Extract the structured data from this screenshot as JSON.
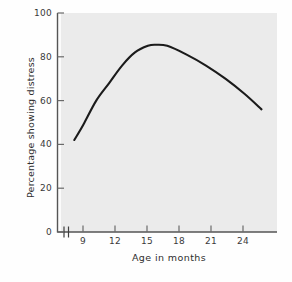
{
  "chart_data": {
    "type": "line",
    "title": "",
    "xlabel": "Age in months",
    "ylabel": "Percentage showing distress",
    "xlim": [
      8,
      25
    ],
    "ylim": [
      0,
      100
    ],
    "xticks": [
      9,
      12,
      15,
      18,
      21,
      24
    ],
    "xtick_labels": [
      "9",
      "12",
      "15",
      "18",
      "21",
      "24"
    ],
    "yticks": [
      0,
      20,
      40,
      60,
      80,
      100
    ],
    "ytick_labels": [
      "0",
      "20",
      "40",
      "60",
      "80",
      "100"
    ],
    "grid": false,
    "legend": null,
    "axis_break_x": true,
    "series": [
      {
        "name": "Percentage showing distress",
        "color": "#1b1b1b",
        "x": [
          9.3,
          10.0,
          11.0,
          12.0,
          13.0,
          14.0,
          15.0,
          15.6,
          16.5,
          18.0,
          19.5,
          21.0,
          22.5,
          23.8
        ],
        "values": [
          42,
          49,
          60,
          68,
          76,
          82,
          85,
          85.5,
          85,
          81,
          76,
          70,
          63,
          56
        ]
      }
    ]
  },
  "axes": {
    "ytick_0": "0",
    "ytick_20": "20",
    "ytick_40": "40",
    "ytick_60": "60",
    "ytick_80": "80",
    "ytick_100": "100",
    "xtick_9": "9",
    "xtick_12": "12",
    "xtick_15": "15",
    "xtick_18": "18",
    "xtick_21": "21",
    "xtick_24": "24",
    "xlabel": "Age in months",
    "ylabel": "Percentage showing distress"
  }
}
